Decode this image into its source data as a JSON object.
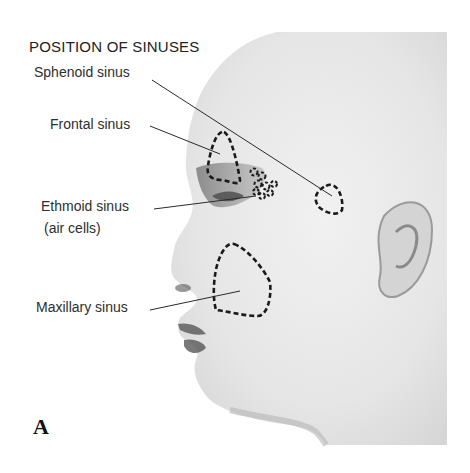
{
  "figure": {
    "title": "POSITION OF SINUSES",
    "panel_letter": "A",
    "labels": {
      "sphenoid": "Sphenoid sinus",
      "frontal": "Frontal sinus",
      "ethmoid": "Ethmoid sinus",
      "ethmoid_sub": "(air cells)",
      "maxillary": "Maxillary sinus"
    },
    "colors": {
      "background": "#ffffff",
      "photo_light": "#ececec",
      "photo_shadow": "#8a8a8a",
      "outline": "#1a1a1a"
    }
  }
}
